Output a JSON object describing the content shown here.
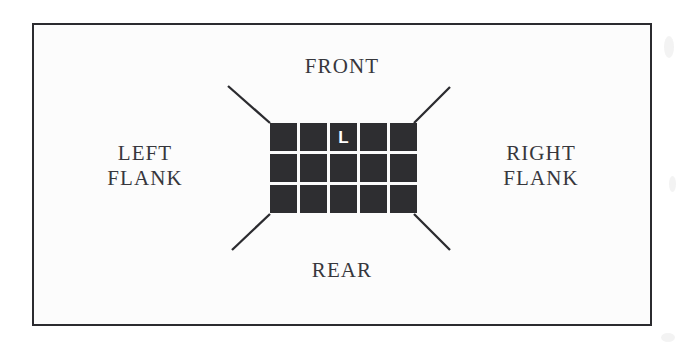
{
  "figure": {
    "background_color": "#fcfcfc",
    "frame_color": "#2b2b2f",
    "cell_color": "#2e2e31",
    "text_color": "#37373c",
    "marker_color": "#ffffff"
  },
  "labels": {
    "front": "FRONT",
    "rear": "REAR",
    "left_flank": "LEFT\nFLANK",
    "right_flank": "RIGHT\nFLANK"
  },
  "formation": {
    "columns": 5,
    "rows": 3,
    "leader_marker": "L",
    "leader_row": 1,
    "leader_column": 3,
    "cells": [
      [
        {
          "mark": ""
        },
        {
          "mark": ""
        },
        {
          "mark": "L"
        },
        {
          "mark": ""
        },
        {
          "mark": ""
        }
      ],
      [
        {
          "mark": ""
        },
        {
          "mark": ""
        },
        {
          "mark": ""
        },
        {
          "mark": ""
        },
        {
          "mark": ""
        }
      ],
      [
        {
          "mark": ""
        },
        {
          "mark": ""
        },
        {
          "mark": ""
        },
        {
          "mark": ""
        },
        {
          "mark": ""
        }
      ]
    ]
  },
  "rays": {
    "count": 4,
    "lines": [
      {
        "name": "front-left-ray",
        "x1": 228,
        "y1": 86,
        "x2": 270,
        "y2": 123
      },
      {
        "name": "front-right-ray",
        "x1": 414,
        "y1": 123,
        "x2": 450,
        "y2": 87
      },
      {
        "name": "rear-left-ray",
        "x1": 270,
        "y1": 214,
        "x2": 232,
        "y2": 250
      },
      {
        "name": "rear-right-ray",
        "x1": 414,
        "y1": 214,
        "x2": 450,
        "y2": 250
      }
    ]
  }
}
